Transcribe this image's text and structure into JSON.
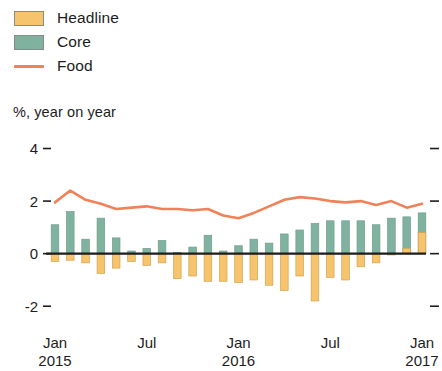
{
  "legend": {
    "items": [
      {
        "label": "Headline",
        "type": "bar",
        "color": "#F5C46C",
        "icon": "square-swatch-icon"
      },
      {
        "label": "Core",
        "type": "bar",
        "color": "#7FB3A0",
        "icon": "square-swatch-icon"
      },
      {
        "label": "Food",
        "type": "line",
        "color": "#F08158",
        "icon": "line-swatch-icon"
      }
    ]
  },
  "chart_data": {
    "type": "bar",
    "title": "",
    "subtitle": "%, year on year",
    "xlabel": "",
    "ylabel": "%, year on year",
    "ylim": [
      -2.6,
      4.4
    ],
    "yticks": [
      4,
      2,
      0,
      -2
    ],
    "ytick_labels": [
      "4",
      "2",
      "0",
      "-2"
    ],
    "grid": false,
    "zero_line": true,
    "legend_position": "top-left",
    "x": [
      "Jan 2015",
      "Feb 2015",
      "Mar 2015",
      "Apr 2015",
      "May 2015",
      "Jun 2015",
      "Jul 2015",
      "Aug 2015",
      "Sep 2015",
      "Oct 2015",
      "Nov 2015",
      "Dec 2015",
      "Jan 2016",
      "Feb 2016",
      "Mar 2016",
      "Apr 2016",
      "May 2016",
      "Jun 2016",
      "Jul 2016",
      "Aug 2016",
      "Sep 2016",
      "Oct 2016",
      "Nov 2016",
      "Dec 2016",
      "Jan 2017"
    ],
    "xtick_positions": [
      0,
      6,
      12,
      18,
      24
    ],
    "xtick_labels": [
      {
        "month": "Jan",
        "year": "2015"
      },
      {
        "month": "Jul",
        "year": ""
      },
      {
        "month": "Jan",
        "year": "2016"
      },
      {
        "month": "Jul",
        "year": ""
      },
      {
        "month": "Jan",
        "year": "2017"
      }
    ],
    "series": [
      {
        "name": "Core",
        "type": "bar",
        "color": "#7FB3A0",
        "values": [
          1.1,
          1.6,
          0.55,
          1.35,
          0.6,
          0.1,
          0.2,
          0.5,
          0.05,
          0.25,
          0.7,
          0.1,
          0.3,
          0.55,
          0.4,
          0.75,
          0.9,
          1.15,
          1.25,
          1.25,
          1.25,
          1.1,
          1.35,
          1.4,
          1.55
        ]
      },
      {
        "name": "Headline",
        "type": "bar",
        "color": "#F5C46C",
        "values": [
          -0.3,
          -0.25,
          -0.35,
          -0.75,
          -0.55,
          -0.3,
          -0.45,
          -0.35,
          -0.95,
          -0.85,
          -1.05,
          -1.05,
          -1.1,
          -1.0,
          -1.2,
          -1.4,
          -0.85,
          -1.8,
          -0.9,
          -1.0,
          -0.5,
          -0.35,
          -0.05,
          0.2,
          0.8
        ]
      },
      {
        "name": "Food",
        "type": "line",
        "color": "#F08158",
        "values": [
          1.95,
          2.4,
          2.05,
          1.9,
          1.7,
          1.75,
          1.8,
          1.7,
          1.7,
          1.65,
          1.7,
          1.45,
          1.35,
          1.55,
          1.8,
          2.05,
          2.15,
          2.1,
          2.0,
          1.95,
          2.0,
          1.85,
          2.0,
          1.75,
          1.9
        ]
      }
    ]
  }
}
